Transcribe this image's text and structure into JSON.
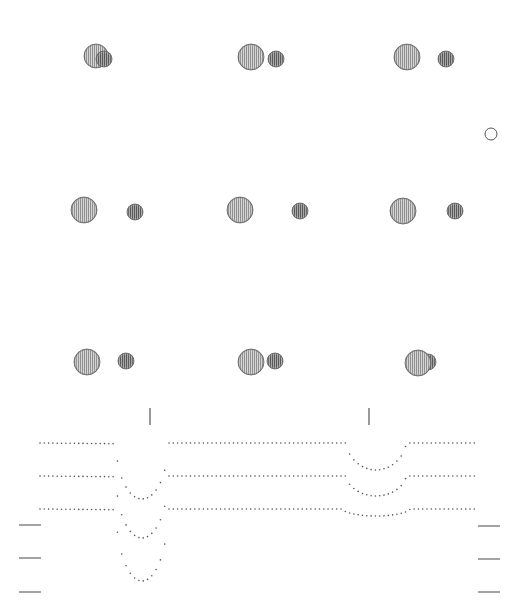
{
  "figure": {
    "colors": {
      "background": "#ffffff",
      "ink": "#333333",
      "primary_fill": "#bdbdbd",
      "secondary_fill": "#8a8a8a",
      "dots": "#555555"
    }
  },
  "binary_phases": [
    {
      "row": 0,
      "col": 0,
      "primary": {
        "cx": 96,
        "cy": 56,
        "r": 12
      },
      "secondary": {
        "cx": 104,
        "cy": 59,
        "r": 8
      },
      "secondary_in_front": true
    },
    {
      "row": 0,
      "col": 1,
      "primary": {
        "cx": 251,
        "cy": 57,
        "r": 13
      },
      "secondary": {
        "cx": 276,
        "cy": 59,
        "r": 8
      },
      "secondary_in_front": false
    },
    {
      "row": 0,
      "col": 2,
      "primary": {
        "cx": 407,
        "cy": 57,
        "r": 13
      },
      "secondary": {
        "cx": 446,
        "cy": 59,
        "r": 8
      },
      "secondary_in_front": false
    },
    {
      "row": 1,
      "col": 0,
      "primary": {
        "cx": 84,
        "cy": 210,
        "r": 13
      },
      "secondary": {
        "cx": 135,
        "cy": 212,
        "r": 8
      },
      "secondary_in_front": false
    },
    {
      "row": 1,
      "col": 1,
      "primary": {
        "cx": 240,
        "cy": 210,
        "r": 13
      },
      "secondary": {
        "cx": 300,
        "cy": 211,
        "r": 8
      },
      "secondary_in_front": false
    },
    {
      "row": 1,
      "col": 2,
      "primary": {
        "cx": 403,
        "cy": 211,
        "r": 13
      },
      "secondary": {
        "cx": 455,
        "cy": 211,
        "r": 8
      },
      "secondary_in_front": false
    },
    {
      "row": 2,
      "col": 0,
      "primary": {
        "cx": 87,
        "cy": 362,
        "r": 13
      },
      "secondary": {
        "cx": 126,
        "cy": 361,
        "r": 8
      },
      "secondary_in_front": false
    },
    {
      "row": 2,
      "col": 1,
      "primary": {
        "cx": 251,
        "cy": 362,
        "r": 13
      },
      "secondary": {
        "cx": 275,
        "cy": 361,
        "r": 8
      },
      "secondary_in_front": false
    },
    {
      "row": 2,
      "col": 2,
      "primary": {
        "cx": 418,
        "cy": 363,
        "r": 13
      },
      "secondary": {
        "cx": 428,
        "cy": 362,
        "r": 8
      },
      "secondary_in_front": false
    }
  ],
  "orbit_marker": {
    "cx": 491,
    "cy": 134,
    "r": 6
  },
  "chart_data": {
    "type": "scatter",
    "title": "",
    "xlabel": "",
    "ylabel": "",
    "grid": false,
    "legend": null,
    "eclipse_markers_x": [
      150,
      369
    ],
    "x_range_px": [
      40,
      475
    ],
    "primary_eclipse_center_px": 142,
    "secondary_eclipse_center_px": 376,
    "series": [
      {
        "name": "curve-1",
        "baseline_y": 443,
        "primary_depth_px": 56,
        "primary_halfwidth_px": 26,
        "secondary_depth_px": 27,
        "secondary_halfwidth_px": 30
      },
      {
        "name": "curve-2",
        "baseline_y": 476,
        "primary_depth_px": 62,
        "primary_halfwidth_px": 26,
        "secondary_depth_px": 20,
        "secondary_halfwidth_px": 30
      },
      {
        "name": "curve-3",
        "baseline_y": 509,
        "primary_depth_px": 72,
        "primary_halfwidth_px": 26,
        "secondary_depth_px": 7,
        "secondary_halfwidth_px": 34
      }
    ],
    "tick_marks": {
      "left": [
        {
          "x1": 19,
          "x2": 41,
          "y": 525
        },
        {
          "x1": 19,
          "x2": 41,
          "y": 558
        },
        {
          "x1": 19,
          "x2": 41,
          "y": 592
        }
      ],
      "right": [
        {
          "x1": 478,
          "x2": 500,
          "y": 526
        },
        {
          "x1": 478,
          "x2": 500,
          "y": 559
        },
        {
          "x1": 478,
          "x2": 500,
          "y": 592
        }
      ]
    }
  }
}
